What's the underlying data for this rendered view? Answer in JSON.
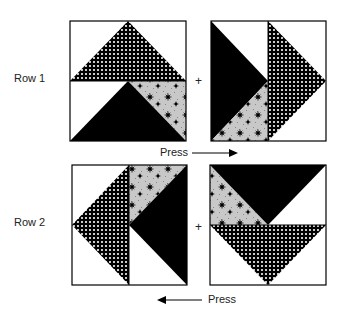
{
  "rows": [
    {
      "label": "Row 1",
      "plus": "+",
      "press_label": "Press",
      "press_direction": "right"
    },
    {
      "label": "Row 2",
      "plus": "+",
      "press_label": "Press",
      "press_direction": "left"
    }
  ],
  "fabrics": {
    "check": "black with white dots (checkerboard print)",
    "solid": "#000000",
    "floral": "gray speckle with black floral motifs",
    "background": "#ffffff"
  },
  "colors": {
    "ink": "#000000",
    "paper": "#ffffff",
    "floral_base": "#c8c8c8"
  }
}
